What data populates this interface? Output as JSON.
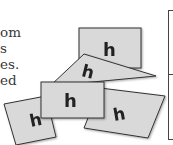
{
  "paragraph": {
    "lines": [
      "om",
      "s",
      "es.",
      "ed"
    ]
  },
  "figure": {
    "card_letter": "h",
    "card_fill": "#d9d9d9",
    "card_stroke": "#333333",
    "letter_color": "#222222"
  }
}
